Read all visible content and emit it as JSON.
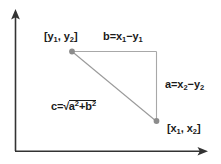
{
  "diagram": {
    "colors": {
      "background": "#ffffff",
      "axis": "#333333",
      "triangle_leg": "#a8a8a8",
      "hypotenuse": "#9a9a9a",
      "vertex_dot": "#8c8c8c",
      "text": "#1a1a1a"
    },
    "axes": {
      "y_axis_name": "vertical-axis-arrow",
      "x_axis_name": "horizontal-axis-arrow"
    },
    "labels": {
      "point_upper": {
        "open_bracket": "[",
        "var1": "y",
        "sub1": "1",
        "separator": ", ",
        "var2": "y",
        "sub2": "2",
        "close_bracket": "]",
        "plain": "[y1, y2]"
      },
      "point_lower": {
        "open_bracket": "[",
        "var1": "x",
        "sub1": "1",
        "separator": ", ",
        "var2": "x",
        "sub2": "2",
        "close_bracket": "]",
        "plain": "[x1, x2]"
      },
      "leg_horizontal": {
        "name": "b",
        "equals": "=",
        "term1_var": "x",
        "term1_sub": "1",
        "operator": "−",
        "term2_var": "y",
        "term2_sub": "1",
        "plain": "b=x1−y1"
      },
      "leg_vertical": {
        "name": "a",
        "equals": "=",
        "term1_var": "x",
        "term1_sub": "2",
        "operator": "−",
        "term2_var": "y",
        "term2_sub": "2",
        "plain": "a=x2−y2"
      },
      "hypotenuse": {
        "name": "c",
        "equals": "=",
        "radical_sign": "√",
        "term1_var": "a",
        "term1_sup": "2",
        "operator": "+",
        "term2_var": "b",
        "term2_sup": "2",
        "plain": "c=√(a²+b²)"
      }
    }
  }
}
